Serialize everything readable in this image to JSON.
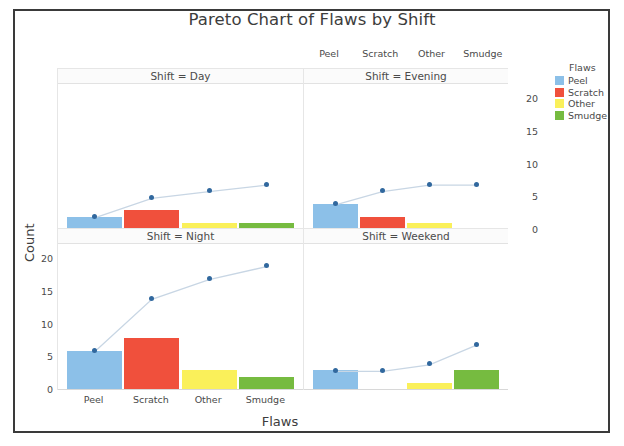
{
  "title": "Pareto Chart of Flaws by Shift",
  "axis": {
    "ylabel": "Count",
    "xlabel": "Flaws",
    "left_ticks": [
      "20",
      "15",
      "10",
      "5",
      "0"
    ],
    "right_ticks": [
      "20",
      "15",
      "10",
      "5",
      "0"
    ],
    "ylim": [
      0,
      22
    ]
  },
  "legend": {
    "title": "Flaws",
    "items": [
      {
        "label": "Peel",
        "color": "#8CC0E8"
      },
      {
        "label": "Scratch",
        "color": "#F0503C"
      },
      {
        "label": "Other",
        "color": "#FAF05A"
      },
      {
        "label": "Smudge",
        "color": "#76BB40"
      }
    ]
  },
  "categories": [
    "Peel",
    "Scratch",
    "Other",
    "Smudge"
  ],
  "panels": [
    {
      "strip": "Shift = Day"
    },
    {
      "strip": "Shift = Evening"
    },
    {
      "strip": "Shift = Night"
    },
    {
      "strip": "Shift = Weekend"
    }
  ],
  "chart_data": {
    "type": "bar",
    "title": "Pareto Chart of Flaws by Shift",
    "xlabel": "Flaws",
    "ylabel": "Count",
    "ylim": [
      0,
      22
    ],
    "categories": [
      "Peel",
      "Scratch",
      "Other",
      "Smudge"
    ],
    "colors": [
      "#8CC0E8",
      "#F0503C",
      "#FAF05A",
      "#76BB40"
    ],
    "grid": false,
    "legend_position": "right",
    "facets": [
      {
        "name": "Shift = Day",
        "values": [
          2,
          3,
          1,
          1
        ],
        "cumulative": [
          2,
          5,
          6,
          7
        ]
      },
      {
        "name": "Shift = Evening",
        "values": [
          4,
          2,
          1,
          0
        ],
        "cumulative": [
          4,
          6,
          7,
          7
        ]
      },
      {
        "name": "Shift = Night",
        "values": [
          6,
          8,
          3,
          2
        ],
        "cumulative": [
          6,
          14,
          17,
          19
        ]
      },
      {
        "name": "Shift = Weekend",
        "values": [
          3,
          0,
          1,
          3
        ],
        "cumulative": [
          3,
          3,
          4,
          7
        ]
      }
    ]
  }
}
